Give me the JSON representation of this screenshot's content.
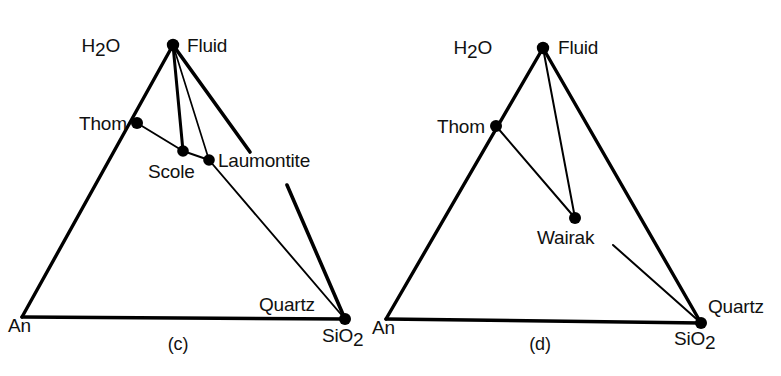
{
  "figure": {
    "type": "ternary-phase-diagrams",
    "background_color": "#ffffff",
    "line_color": "#000000",
    "point_color": "#000000",
    "panels": [
      {
        "id": "panel-c",
        "caption": "(c)",
        "caption_pos": [
          178,
          347
        ],
        "vertices": {
          "left": {
            "label": "An",
            "label_pos": [
              8,
              330
            ],
            "point": [
              22,
              317
            ]
          },
          "apex": {
            "label_left": "H₂O",
            "label_right": "Fluid",
            "label_left_pos": [
              120,
              52
            ],
            "label_right_pos": [
              187,
              52
            ],
            "point": [
              173,
              45
            ]
          },
          "right": {
            "label": "SiO₂",
            "label_pos": [
              325,
              340
            ],
            "point": [
              345,
              319
            ]
          }
        },
        "points": [
          {
            "name": "Thom",
            "label": "Thom",
            "label_pos": [
              79,
              130
            ],
            "point": [
              137,
              123
            ],
            "label_anchor": "start"
          },
          {
            "name": "Scole",
            "label": "Scole",
            "label_pos": [
              148,
              177
            ],
            "point": [
              183,
              151
            ],
            "label_anchor": "start"
          },
          {
            "name": "Laumontite",
            "label": "Laumontite",
            "label_pos": [
              217,
              167
            ],
            "point": [
              209,
              160
            ],
            "label_anchor": "start"
          },
          {
            "name": "Quartz",
            "label": "Quartz",
            "label_pos": [
              260,
              310
            ],
            "point": [
              345,
              319
            ],
            "label_anchor": "start"
          }
        ],
        "edges": [
          {
            "from": "An",
            "to": "H2O",
            "weight": "thick"
          },
          {
            "from": "An",
            "to": "SiO2",
            "weight": "thick"
          },
          {
            "from": "H2O",
            "to": "SiO2",
            "weight": "thick"
          },
          {
            "from": "H2O",
            "to": "Scole",
            "weight": "thick"
          },
          {
            "from": "H2O",
            "to": "Laumontite",
            "weight": "thin"
          },
          {
            "from": "Thom",
            "to": "Scole",
            "weight": "thin"
          },
          {
            "from": "Scole",
            "to": "Laumontite",
            "weight": "thin"
          },
          {
            "from": "Laumontite",
            "to": "SiO2",
            "weight": "thin"
          }
        ]
      },
      {
        "id": "panel-d",
        "caption": "(d)",
        "caption_pos": [
          540,
          347
        ],
        "vertices": {
          "left": {
            "label": "An",
            "label_pos": [
              372,
              332
            ],
            "point": [
              386,
              319
            ]
          },
          "apex": {
            "label_left": "H₂O",
            "label_right": "Fluid",
            "label_left_pos": [
              492,
              53
            ],
            "label_right_pos": [
              558,
              53
            ],
            "point": [
              543,
              48
            ]
          },
          "right": {
            "label": "SiO₂",
            "label_pos": [
              676,
              343
            ],
            "point": [
              701,
              323
            ]
          }
        },
        "points": [
          {
            "name": "Thom",
            "label": "Thom",
            "label_pos": [
              437,
              133
            ],
            "point": [
              496,
              126
            ],
            "label_anchor": "start"
          },
          {
            "name": "Wairak",
            "label": "Wairak",
            "label_pos": [
              537,
              243
            ],
            "point": [
              575,
              218
            ],
            "label_anchor": "start"
          },
          {
            "name": "Quartz",
            "label": "Quartz",
            "label_pos": [
              709,
              312
            ],
            "point": [
              701,
              323
            ],
            "label_anchor": "start"
          }
        ],
        "edges": [
          {
            "from": "An",
            "to": "H2O",
            "weight": "thick"
          },
          {
            "from": "An",
            "to": "SiO2",
            "weight": "thick"
          },
          {
            "from": "H2O",
            "to": "SiO2",
            "weight": "thick"
          },
          {
            "from": "H2O",
            "to": "Wairak",
            "weight": "thin"
          },
          {
            "from": "Thom",
            "to": "Wairak",
            "weight": "thin"
          },
          {
            "from": "Wairak",
            "to": "SiO2",
            "weight": "thin"
          }
        ]
      }
    ]
  }
}
